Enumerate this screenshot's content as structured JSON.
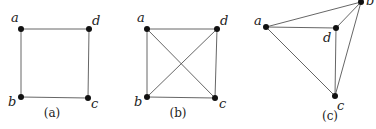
{
  "figures": [
    {
      "caption": "(a)",
      "caption_pos": [
        52,
        117
      ],
      "vertices": [
        {
          "id": "a",
          "label": "a",
          "x": 21,
          "y": 29,
          "lx": 11,
          "ly": 22
        },
        {
          "id": "d",
          "label": "d",
          "x": 89,
          "y": 29,
          "lx": 92,
          "ly": 25
        },
        {
          "id": "b",
          "label": "b",
          "x": 21,
          "y": 97,
          "lx": 8,
          "ly": 106
        },
        {
          "id": "c",
          "label": "c",
          "x": 88,
          "y": 98,
          "lx": 91,
          "ly": 108
        }
      ],
      "edges": [
        [
          "a",
          "d"
        ],
        [
          "a",
          "b"
        ],
        [
          "b",
          "c"
        ],
        [
          "d",
          "c"
        ]
      ]
    },
    {
      "caption": "(b)",
      "caption_pos": [
        178,
        117
      ],
      "vertices": [
        {
          "id": "a",
          "label": "a",
          "x": 147,
          "y": 29,
          "lx": 137,
          "ly": 22
        },
        {
          "id": "d",
          "label": "d",
          "x": 217,
          "y": 29,
          "lx": 220,
          "ly": 25
        },
        {
          "id": "b",
          "label": "b",
          "x": 147,
          "y": 97,
          "lx": 134,
          "ly": 106
        },
        {
          "id": "c",
          "label": "c",
          "x": 215,
          "y": 98,
          "lx": 219,
          "ly": 108
        }
      ],
      "edges": [
        [
          "a",
          "d"
        ],
        [
          "a",
          "b"
        ],
        [
          "b",
          "c"
        ],
        [
          "d",
          "c"
        ],
        [
          "a",
          "c"
        ],
        [
          "b",
          "d"
        ]
      ]
    },
    {
      "caption": "(c)",
      "caption_pos": [
        330,
        120
      ],
      "vertices": [
        {
          "id": "a",
          "label": "a",
          "x": 266,
          "y": 27,
          "lx": 254,
          "ly": 25
        },
        {
          "id": "b",
          "label": "b",
          "x": 361,
          "y": 2,
          "lx": 366,
          "ly": 5
        },
        {
          "id": "d",
          "label": "d",
          "x": 336,
          "y": 28,
          "lx": 323,
          "ly": 42
        },
        {
          "id": "c",
          "label": "c",
          "x": 335,
          "y": 96,
          "lx": 337,
          "ly": 110
        }
      ],
      "edges": [
        [
          "a",
          "b"
        ],
        [
          "a",
          "d"
        ],
        [
          "a",
          "c"
        ],
        [
          "d",
          "b"
        ],
        [
          "d",
          "c"
        ],
        [
          "b",
          "c"
        ]
      ]
    }
  ]
}
